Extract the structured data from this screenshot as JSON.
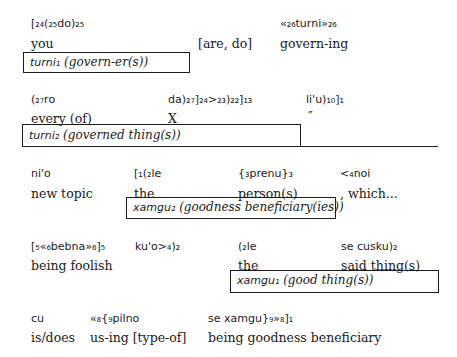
{
  "rows": [
    {
      "columns": [
        {
          "lojban": "[₂₄(₂₅do)₂₅",
          "gloss": "you"
        },
        {
          "lojban": "",
          "gloss": "[are, do]"
        },
        {
          "lojban": "«₂₆turni»₂₆",
          "gloss": "govern-ing"
        }
      ],
      "boxes": [
        {
          "term": "turni₁",
          "desc": "(govern-er(s))"
        }
      ]
    },
    {
      "columns": [
        {
          "lojban": "(₂₇ro",
          "gloss": "every (of)"
        },
        {
          "lojban": "da)₂₇]₂₄>₂₃)₂₂]₁₃",
          "gloss": "X"
        },
        {
          "lojban": "li'u)₁₀]₁",
          "gloss": "″"
        }
      ],
      "boxes": [
        {
          "term": "turni₂",
          "desc": "(governed thing(s))"
        }
      ]
    },
    {
      "columns": [
        {
          "lojban": "ni'o",
          "gloss": "new topic"
        },
        {
          "lojban": "[₁(₂le",
          "gloss": "the"
        },
        {
          "lojban": "{₃prenu}₃",
          "gloss": "person(s)"
        },
        {
          "lojban": "<₄noi",
          "gloss": ", which..."
        }
      ],
      "boxes": [
        {
          "term": "xamgu₂",
          "desc": "(goodness beneficiary(ies))"
        }
      ]
    },
    {
      "columns": [
        {
          "lojban": "[₅«₆bebna»₆]₅",
          "gloss": "being foolish"
        },
        {
          "lojban": "ku'o>₄)₂",
          "gloss": ""
        },
        {
          "lojban": "(₂le",
          "gloss": "the"
        },
        {
          "lojban": "se cusku)₂",
          "gloss": "said thing(s)"
        }
      ],
      "boxes": [
        {
          "term": "xamgu₁",
          "desc": "(good thing(s))"
        }
      ]
    },
    {
      "columns": [
        {
          "lojban": "cu",
          "gloss": "is/does"
        },
        {
          "lojban": "«₈{₉pilno",
          "gloss": "us-ing [type-of]"
        },
        {
          "lojban": "se xamgu}₉»₈]₁",
          "gloss": "being goodness beneficiary"
        }
      ],
      "boxes": []
    }
  ]
}
